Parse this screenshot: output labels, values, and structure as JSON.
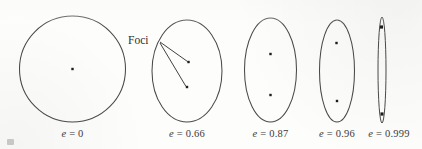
{
  "figure": {
    "background_color": "#fdfdfc",
    "stroke_color": "#4a4a4a",
    "dot_color": "#1d1d1d",
    "text_color": "#3b3b3b",
    "annotation": {
      "label": "Foci",
      "target_shape_index": 1
    }
  },
  "chart_data": {
    "type": "diagram",
    "xlabel": "",
    "ylabel": "",
    "series_label": "eccentricity",
    "categories": [
      "e = 0",
      "e = 0.66",
      "e = 0.87",
      "e = 0.96",
      "e = 0.999"
    ],
    "values": [
      0,
      0.66,
      0.87,
      0.96,
      0.999
    ],
    "shapes": [
      {
        "index": 0,
        "eccentricity": 0,
        "caption": "e = 0",
        "caption_symbol": "e",
        "caption_value": "0",
        "center_x": 72.5,
        "center_y": 69,
        "semi_major": 53,
        "semi_minor": 53,
        "caption_x": 72.5,
        "caption_y": 137,
        "foci": [
          {
            "x": 72.5,
            "y": 69
          }
        ]
      },
      {
        "index": 1,
        "eccentricity": 0.66,
        "caption": "e = 0.66",
        "caption_symbol": "e",
        "caption_value": "0.66",
        "center_x": 187,
        "center_y": 71,
        "semi_major": 51,
        "semi_minor": 35,
        "caption_x": 187,
        "caption_y": 137,
        "foci": [
          {
            "x": 188.5,
            "y": 62
          },
          {
            "x": 187,
            "y": 87
          }
        ]
      },
      {
        "index": 2,
        "eccentricity": 0.87,
        "caption": "e = 0.87",
        "caption_symbol": "e",
        "caption_value": "0.87",
        "center_x": 270.5,
        "center_y": 70,
        "semi_major": 52,
        "semi_minor": 26,
        "caption_x": 270.5,
        "caption_y": 137,
        "foci": [
          {
            "x": 270.5,
            "y": 54
          },
          {
            "x": 270.5,
            "y": 95
          }
        ]
      },
      {
        "index": 3,
        "eccentricity": 0.96,
        "caption": "e = 0.96",
        "caption_symbol": "e",
        "caption_value": "0.96",
        "center_x": 337,
        "center_y": 71,
        "semi_major": 51,
        "semi_minor": 17.5,
        "caption_x": 337,
        "caption_y": 137,
        "foci": [
          {
            "x": 336.5,
            "y": 43
          },
          {
            "x": 337,
            "y": 101
          }
        ]
      },
      {
        "index": 4,
        "eccentricity": 0.999,
        "caption": "e = 0.999",
        "caption_symbol": "e",
        "caption_value": "0.999",
        "center_x": 382,
        "center_y": 70,
        "semi_major": 53,
        "semi_minor": 4,
        "caption_x": 389,
        "caption_y": 137,
        "foci": [
          {
            "x": 381.5,
            "y": 27
          },
          {
            "x": 382,
            "y": 114
          }
        ]
      }
    ],
    "annotations": [
      {
        "text": "Foci",
        "x": 128,
        "y": 44,
        "leader_lines": [
          {
            "x1": 160,
            "y1": 42,
            "x2": 187.5,
            "y2": 61.5
          },
          {
            "x1": 160,
            "y1": 43,
            "x2": 186,
            "y2": 86.5
          }
        ]
      }
    ],
    "grid": false,
    "legend": "none"
  }
}
